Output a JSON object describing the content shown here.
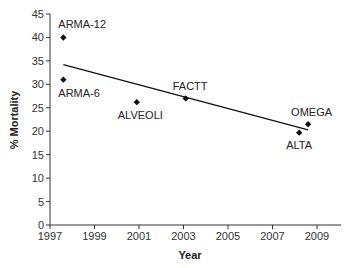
{
  "chart_data": {
    "type": "scatter",
    "title": "",
    "xlabel": "Year",
    "ylabel": "% Mortality",
    "xlim": [
      1997,
      2010
    ],
    "ylim": [
      0,
      45
    ],
    "xticks": [
      1997,
      1999,
      2001,
      2003,
      2005,
      2007,
      2009
    ],
    "yticks": [
      0,
      5,
      10,
      15,
      20,
      25,
      30,
      35,
      40,
      45
    ],
    "grid": false,
    "legend": null,
    "points": [
      {
        "label": "ARMA-12",
        "x": 1997.6,
        "y": 40,
        "label_pos": "above"
      },
      {
        "label": "ARMA-6",
        "x": 1997.6,
        "y": 31,
        "label_pos": "below"
      },
      {
        "label": "ALVEOLI",
        "x": 2000.9,
        "y": 26.2,
        "label_pos": "below"
      },
      {
        "label": "FACTT",
        "x": 2003.1,
        "y": 27,
        "label_pos": "above"
      },
      {
        "label": "ALTA",
        "x": 2008.2,
        "y": 19.7,
        "label_pos": "below"
      },
      {
        "label": "OMEGA",
        "x": 2008.6,
        "y": 21.5,
        "label_pos": "above"
      }
    ],
    "trendline": {
      "x": [
        1997.6,
        2008.6
      ],
      "y": [
        34.2,
        20.3
      ]
    },
    "marker": "diamond",
    "color": "#111111"
  }
}
